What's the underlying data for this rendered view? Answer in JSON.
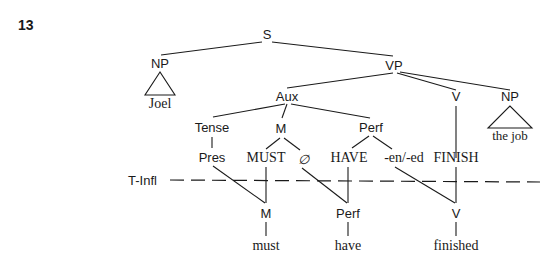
{
  "example_number": "13",
  "boundary_label": "T-Infl",
  "nodes": {
    "S": "S",
    "NP_subj": "NP",
    "joel": "Joel",
    "VP": "VP",
    "Aux": "Aux",
    "V_top": "V",
    "NP_obj": "NP",
    "the_job": "the job",
    "Tense": "Tense",
    "M_top": "M",
    "Perf_top": "Perf",
    "Pres": "Pres",
    "MUST": "MUST",
    "null": "∅",
    "HAVE": "HAVE",
    "en_ed": "-en/-ed",
    "FINISH": "FINISH",
    "M_bottom": "M",
    "Perf_bottom": "Perf",
    "V_bottom": "V",
    "must": "must",
    "have": "have",
    "finished": "finished"
  },
  "colors": {
    "ink": "#1a1a1a",
    "background": "#ffffff"
  }
}
